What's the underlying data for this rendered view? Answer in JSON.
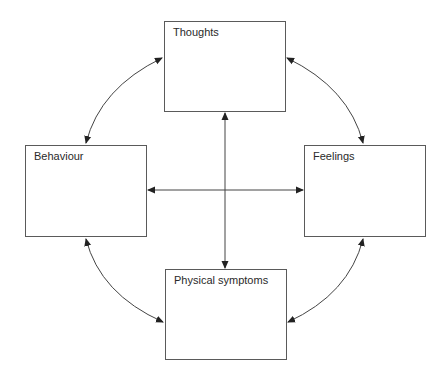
{
  "diagram": {
    "title": "",
    "nodes": [
      {
        "id": "thoughts",
        "label": "Thoughts",
        "x": 164,
        "y": 21,
        "w": 122,
        "h": 91
      },
      {
        "id": "behaviour",
        "label": "Behaviour",
        "x": 25,
        "y": 145,
        "w": 122,
        "h": 92
      },
      {
        "id": "feelings",
        "label": "Feelings",
        "x": 304,
        "y": 145,
        "w": 122,
        "h": 92
      },
      {
        "id": "physical_symptoms",
        "label": "Physical symptoms",
        "x": 165,
        "y": 269,
        "w": 122,
        "h": 91
      }
    ],
    "edges": [
      {
        "from": "thoughts",
        "to": "behaviour",
        "type": "curved",
        "direction": "bidirectional"
      },
      {
        "from": "thoughts",
        "to": "feelings",
        "type": "curved",
        "direction": "bidirectional"
      },
      {
        "from": "behaviour",
        "to": "physical_symptoms",
        "type": "curved",
        "direction": "bidirectional"
      },
      {
        "from": "feelings",
        "to": "physical_symptoms",
        "type": "curved",
        "direction": "bidirectional"
      },
      {
        "from": "thoughts",
        "to": "physical_symptoms",
        "type": "straight",
        "direction": "bidirectional"
      },
      {
        "from": "behaviour",
        "to": "feelings",
        "type": "straight",
        "direction": "bidirectional"
      }
    ],
    "colors": {
      "stroke": "#444444",
      "text": "#2a2a2a",
      "background": "#ffffff"
    }
  }
}
